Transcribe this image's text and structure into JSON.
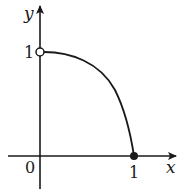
{
  "diagram": {
    "type": "function-graph",
    "function": "y = 1 - x^2",
    "domain": "0 < x <= 1",
    "colors": {
      "stroke": "#1a1a1a",
      "background": "#ffffff"
    },
    "axes": {
      "x_label": "x",
      "y_label": "y",
      "origin_label": "0"
    },
    "ticks": {
      "x_one": "1",
      "y_one": "1"
    },
    "points": [
      {
        "x": 0,
        "y": 1,
        "style": "open"
      },
      {
        "x": 1,
        "y": 0,
        "style": "closed"
      }
    ]
  }
}
